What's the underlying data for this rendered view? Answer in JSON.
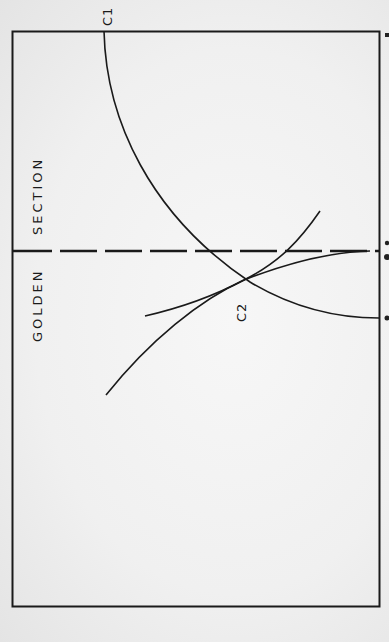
{
  "diagram": {
    "title_left": "GOLDEN",
    "title_right": "SECTION",
    "curve_labels": {
      "c1": "C1",
      "c2": "C2"
    },
    "colors": {
      "ink": "#1a1a1a",
      "paper": "#f3f3f3"
    },
    "elements": [
      {
        "type": "rectangle",
        "name": "frame"
      },
      {
        "type": "dashed-line",
        "name": "golden-section-divider"
      },
      {
        "type": "arc",
        "name": "curve-c1"
      },
      {
        "type": "arc",
        "name": "curve-c2"
      },
      {
        "type": "arc",
        "name": "tangent-curve"
      }
    ]
  }
}
